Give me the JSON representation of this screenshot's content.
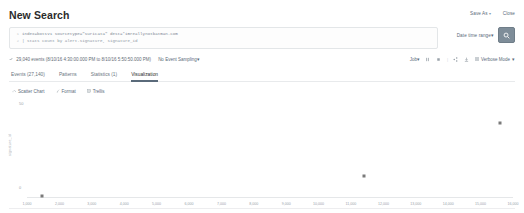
{
  "header": {
    "title": "New Search",
    "save_as_label": "Save As",
    "close_label": "Close",
    "caret": "▾"
  },
  "search": {
    "line1_gutter": "1",
    "line1_text": "index=botsv1 sourcetype=\"suricata\" dest=*imreallynotbatman.com",
    "line2_gutter": "2",
    "line2_text": "| stats count by alert.signature, signature_id",
    "date_range_label": "Date time range",
    "submit_icon": "search-icon"
  },
  "results_meta": {
    "count_text": "29,040 events (8/10/16 4:30:00.000 PM to 8/10/16 5:50:50.000 PM)",
    "sampling_label": "No Event Sampling",
    "job_label": "Job",
    "mode_label": "Verbose Mode",
    "caret": "▾",
    "icons": [
      "pause-icon",
      "stop-icon",
      "share-icon",
      "print-icon",
      "export-icon"
    ]
  },
  "tabs": [
    {
      "label": "Events (27,140)",
      "active": false
    },
    {
      "label": "Patterns",
      "active": false
    },
    {
      "label": "Statistics (1)",
      "active": false
    },
    {
      "label": "Visualization",
      "active": true
    }
  ],
  "viz_toolbar": [
    {
      "label": "Scatter Chart",
      "icon": "chart-icon"
    },
    {
      "label": "Format",
      "icon": "paintbrush-icon"
    },
    {
      "label": "Trellis",
      "icon": "grid-icon"
    }
  ],
  "chart_data": {
    "type": "scatter",
    "title": "",
    "xlabel": "count",
    "ylabel": "signature_id",
    "corner_label": "50",
    "ytick_labels": [
      "0"
    ],
    "xlim": [
      1000,
      16000
    ],
    "ylim": [
      0,
      60
    ],
    "grid": false,
    "legend": "none",
    "categories": [],
    "xtick_labels": [
      "1,000",
      "2,000",
      "3,000",
      "4,000",
      "5,000",
      "6,000",
      "7,000",
      "8,000",
      "9,000",
      "10,000",
      "11,000",
      "12,000",
      "13,000",
      "14,000",
      "15,000",
      "16,000"
    ],
    "series": [
      {
        "name": "signature_id",
        "points": [
          {
            "x": 1450,
            "y": 1
          },
          {
            "x": 11400,
            "y": 14
          },
          {
            "x": 15600,
            "y": 50
          }
        ]
      }
    ]
  }
}
